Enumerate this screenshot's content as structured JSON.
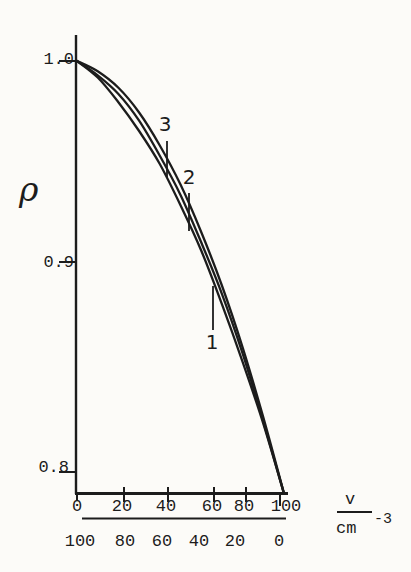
{
  "figure": {
    "background": "#fcfbf8",
    "ink": "#1c1c1c"
  },
  "y_axis": {
    "label": "ρ",
    "tick_labels": [
      "1.0",
      "0.9",
      "0.8"
    ]
  },
  "x_axis": {
    "top_scale_labels": [
      "0",
      "20",
      "40",
      "60",
      "80",
      "100"
    ],
    "bottom_scale_labels": [
      "100",
      "80",
      "60",
      "40",
      "20",
      "0"
    ],
    "unit": {
      "numerator": "v",
      "denominator": "cm",
      "exponent": "-3"
    }
  },
  "curve_labels": {
    "curve1": "1",
    "curve2": "2",
    "curve3": "3"
  },
  "chart_data": {
    "type": "line",
    "title": "",
    "xlabel": "v / cm⁻³",
    "ylabel": "ρ",
    "xlim": [
      0,
      100
    ],
    "ylim": [
      0.79,
      1.0
    ],
    "grid": false,
    "legend_position": "inline curve labels 1,2,3 with leader ticks",
    "x": [
      0,
      10,
      20,
      30,
      40,
      50,
      60,
      70,
      80,
      90,
      100
    ],
    "x_axis_secondary_scale": [
      100,
      80,
      60,
      40,
      20,
      0
    ],
    "series": [
      {
        "name": "1",
        "values": [
          1.0,
          0.992,
          0.98,
          0.966,
          0.95,
          0.93,
          0.908,
          0.882,
          0.854,
          0.824,
          0.79
        ]
      },
      {
        "name": "2",
        "values": [
          1.0,
          0.993,
          0.984,
          0.971,
          0.954,
          0.935,
          0.912,
          0.887,
          0.858,
          0.825,
          0.79
        ]
      },
      {
        "name": "3",
        "values": [
          1.0,
          0.995,
          0.987,
          0.975,
          0.959,
          0.94,
          0.917,
          0.891,
          0.861,
          0.827,
          0.79
        ]
      }
    ]
  }
}
